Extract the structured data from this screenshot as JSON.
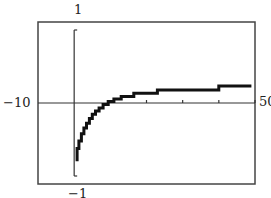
{
  "chart_data": {
    "type": "line",
    "title": "",
    "xlabel": "",
    "ylabel": "",
    "xlim": [
      -10,
      50
    ],
    "ylim": [
      -1,
      1
    ],
    "grid": false,
    "legend": null,
    "x_tick_step": 10,
    "labels": {
      "xmin": "−10",
      "xmax": "50",
      "ymax": "1",
      "ymin": "−1"
    },
    "series": [
      {
        "name": "step approximation",
        "style": "step",
        "points": [
          [
            0.8,
            -0.72
          ],
          [
            0.8,
            -0.56
          ],
          [
            1.3,
            -0.56
          ],
          [
            1.3,
            -0.47
          ],
          [
            2.0,
            -0.47
          ],
          [
            2.0,
            -0.38
          ],
          [
            2.7,
            -0.38
          ],
          [
            2.7,
            -0.31
          ],
          [
            3.4,
            -0.31
          ],
          [
            3.4,
            -0.25
          ],
          [
            4.2,
            -0.25
          ],
          [
            4.2,
            -0.19
          ],
          [
            5.0,
            -0.19
          ],
          [
            5.0,
            -0.14
          ],
          [
            5.9,
            -0.14
          ],
          [
            5.9,
            -0.1
          ],
          [
            6.9,
            -0.1
          ],
          [
            6.9,
            -0.06
          ],
          [
            8.0,
            -0.06
          ],
          [
            8.0,
            -0.02
          ],
          [
            9.4,
            -0.02
          ],
          [
            9.4,
            0.02
          ],
          [
            11.0,
            0.02
          ],
          [
            11.0,
            0.05
          ],
          [
            13.0,
            0.05
          ],
          [
            13.0,
            0.08
          ],
          [
            16.5,
            0.08
          ],
          [
            16.5,
            0.12
          ],
          [
            23.0,
            0.12
          ],
          [
            23.0,
            0.16
          ],
          [
            40.0,
            0.16
          ],
          [
            40.0,
            0.21
          ],
          [
            49.0,
            0.21
          ]
        ]
      }
    ]
  }
}
